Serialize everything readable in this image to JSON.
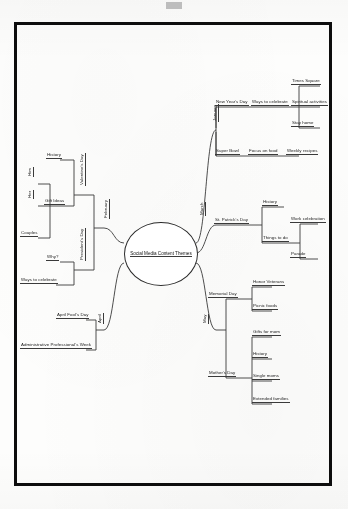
{
  "document": {
    "type": "mind-map",
    "title": "Social Media Content Themes",
    "border_color": "#0d0d0d",
    "background_color": "#fdfdfc",
    "connector_color": "#3a3a3a"
  },
  "center": {
    "label": "Social Media Content Themes"
  },
  "branches": {
    "january": {
      "label": "January",
      "children": [
        {
          "label": "New Year's Day",
          "children": [
            {
              "label": "Ways to celebrate",
              "children": [
                {
                  "label": "Times Square"
                },
                {
                  "label": "Spiritual activities"
                },
                {
                  "label": "Stay home"
                }
              ]
            }
          ]
        },
        {
          "label": "Super Bowl",
          "children": [
            {
              "label": "Focus on food",
              "children": [
                {
                  "label": "Weekly recipes"
                }
              ]
            }
          ]
        }
      ]
    },
    "march": {
      "label": "March",
      "children": [
        {
          "label": "St. Patrick's Day",
          "children": [
            {
              "label": "History"
            },
            {
              "label": "Things to do",
              "children": [
                {
                  "label": "Work celebration"
                },
                {
                  "label": "Parade"
                }
              ]
            }
          ]
        }
      ]
    },
    "may": {
      "label": "May",
      "children": [
        {
          "label": "Memorial Day",
          "children": [
            {
              "label": "Honor Veterans"
            },
            {
              "label": "Picnic foods"
            }
          ]
        },
        {
          "label": "Mother's Day",
          "children": [
            {
              "label": "Gifts for mom"
            },
            {
              "label": "History"
            },
            {
              "label": "Single moms"
            },
            {
              "label": "Extended families"
            }
          ]
        }
      ]
    },
    "february": {
      "label": "February",
      "children": [
        {
          "label": "Valentine's Day",
          "children": [
            {
              "label": "History"
            },
            {
              "label": "Gift Ideas",
              "children": [
                {
                  "label": "Him"
                },
                {
                  "label": "Her"
                },
                {
                  "label": "Couples"
                }
              ]
            }
          ]
        },
        {
          "label": "President's Day",
          "children": [
            {
              "label": "Why?"
            },
            {
              "label": "Ways to celebrate"
            }
          ]
        }
      ]
    },
    "april": {
      "label": "April",
      "children": [
        {
          "label": "April Fool's Day"
        },
        {
          "label": "Administrative Professional's Week"
        }
      ]
    }
  }
}
